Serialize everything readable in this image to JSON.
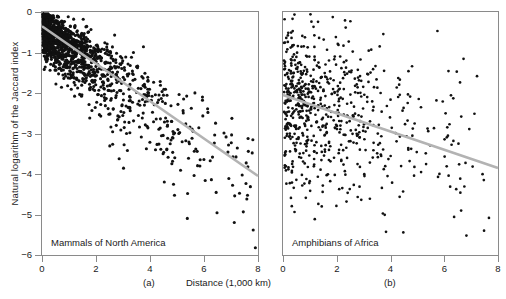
{
  "figure": {
    "y_axis_title": "Natural logarithm of the Jaccard index",
    "x_axis_title": "Distance (1,000 km)",
    "point_color": "#111111",
    "line_color": "#b3b3b3",
    "axis_color": "#8a8a8a"
  },
  "chart_data": [
    {
      "type": "scatter",
      "title": "Mammals of North America",
      "panel_label": "(a)",
      "xlabel": "Distance (1,000 km)",
      "ylabel": "Natural logarithm of the Jaccard index",
      "xlim": [
        0,
        8
      ],
      "ylim": [
        -6,
        0
      ],
      "xticks": [
        0,
        2,
        4,
        6,
        8
      ],
      "yticks": [
        0,
        -1,
        -2,
        -3,
        -4,
        -5,
        -6
      ],
      "xticklabels": [
        "0",
        "2",
        "4",
        "6",
        "8"
      ],
      "yticklabels": [
        "0",
        "-1",
        "-2",
        "-3",
        "-4",
        "-5",
        "-6"
      ],
      "grid": false,
      "legend": "none",
      "n_points": 1500,
      "trend_line": {
        "x": [
          0,
          8
        ],
        "y": [
          -0.35,
          -4.05
        ],
        "slope": -0.4625,
        "intercept": -0.35,
        "color": "#b3b3b3"
      },
      "cloud_model": {
        "x_distribution": "right-skewed, peak near 1.2",
        "y_mean_at_x0": -0.35,
        "y_mean_at_x8": -4.05,
        "y_spread_at_x0": 0.28,
        "y_spread_at_x8": 0.95
      }
    },
    {
      "type": "scatter",
      "title": "Amphibians of Africa",
      "panel_label": "(b)",
      "xlabel": "Distance (1,000 km)",
      "ylabel": "Natural logarithm of the Jaccard index",
      "xlim": [
        0,
        8
      ],
      "ylim": [
        -6,
        0
      ],
      "xticks": [
        0,
        2,
        4,
        6,
        8
      ],
      "yticks": [
        0,
        -1,
        -2,
        -3,
        -4,
        -5,
        -6
      ],
      "xticklabels": [
        "0",
        "2",
        "4",
        "6",
        "8"
      ],
      "yticklabels": [
        "0",
        "-1",
        "-2",
        "-3",
        "-4",
        "-5",
        "-6"
      ],
      "grid": false,
      "legend": "none",
      "n_points": 700,
      "trend_line": {
        "x": [
          0,
          8
        ],
        "y": [
          -2.05,
          -3.85
        ],
        "slope": -0.225,
        "intercept": -2.05,
        "color": "#b3b3b3"
      },
      "cloud_model": {
        "x_distribution": "right-skewed, peak near 2.2",
        "y_mean_at_x0": -2.15,
        "y_mean_at_x8": -3.6,
        "y_spread_at_x0": 0.95,
        "y_spread_at_x8": 1.15
      }
    }
  ]
}
